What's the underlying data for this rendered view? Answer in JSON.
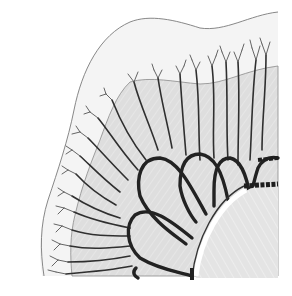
{
  "figure": {
    "description": "Scientific line drawing of one quadrant of a medusa (jellyfish) showing umbrella margin, radial canals with branching tips, scalloped lobes and central stomach region",
    "colors": {
      "background": "#ffffff",
      "umbrella_fill": "#dcdcdc",
      "outer_fill": "#f2f2f2",
      "line_dark": "#2b2b2b",
      "line_thin": "#6a6a6a",
      "stomach_fill": "#e6e6e6",
      "highlight": "#ffffff"
    },
    "parts": {
      "outer_margin": "outer umbrella margin outline",
      "inner_margin": "inner shaded umbrella region",
      "lobes": 5,
      "radial_canals": 24,
      "stomach": "central stomach arc"
    }
  }
}
